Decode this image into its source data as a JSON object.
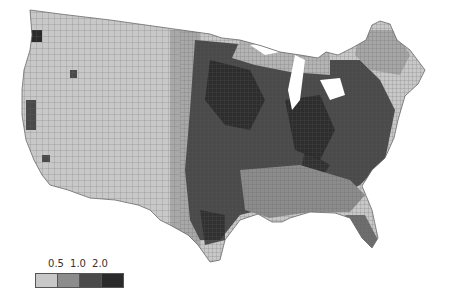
{
  "map": {
    "type": "choropleth",
    "region": "Contiguous United States (counties)",
    "colors": {
      "background": "#ffffff",
      "county_border": "#6a6a6a",
      "class_1": "#c8c8c8",
      "class_2": "#8c8c8c",
      "class_3": "#4a4a4a",
      "class_4": "#2a2a2a"
    }
  },
  "legend": {
    "breaks": [
      "0.5",
      "1.0",
      "2.0"
    ],
    "classes": [
      {
        "label": "< 0.5",
        "color": "#c8c8c8"
      },
      {
        "label": "0.5 – 1.0",
        "color": "#8c8c8c"
      },
      {
        "label": "1.0 – 2.0",
        "color": "#4a4a4a"
      },
      {
        "label": "> 2.0",
        "color": "#2a2a2a"
      }
    ]
  }
}
